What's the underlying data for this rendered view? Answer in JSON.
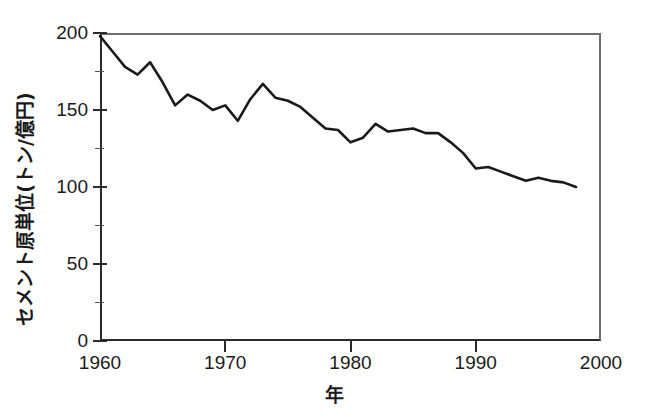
{
  "chart_data": {
    "type": "line",
    "title": "",
    "subtitle": "",
    "xlabel": "年",
    "ylabel": "セメント原単位(トン/億円)",
    "xlim": [
      1960,
      2000
    ],
    "ylim": [
      0,
      200
    ],
    "grid": false,
    "legend": null,
    "x_ticks": [
      1960,
      1970,
      1980,
      1990,
      2000
    ],
    "x_tick_labels": [
      "1960",
      "1970",
      "1980",
      "1990",
      "2000"
    ],
    "y_ticks": [
      0,
      50,
      100,
      150,
      200
    ],
    "y_tick_labels": [
      "0",
      "50",
      "100",
      "150",
      "200"
    ],
    "y_minor_ticks": [
      25,
      75,
      125,
      175
    ],
    "line_color": "#1a1a1a",
    "axis_color": "#2b2b2b",
    "series": [
      {
        "name": "セメント原単位",
        "x": [
          1960,
          1961,
          1962,
          1963,
          1964,
          1965,
          1966,
          1967,
          1968,
          1969,
          1970,
          1971,
          1972,
          1973,
          1974,
          1975,
          1976,
          1977,
          1978,
          1979,
          1980,
          1981,
          1982,
          1983,
          1984,
          1985,
          1986,
          1987,
          1988,
          1989,
          1990,
          1991,
          1992,
          1993,
          1994,
          1995,
          1996,
          1997,
          1998
        ],
        "y": [
          198,
          188,
          178,
          173,
          181,
          168,
          153,
          160,
          156,
          150,
          153,
          143,
          157,
          167,
          158,
          156,
          152,
          145,
          138,
          137,
          129,
          132,
          141,
          136,
          137,
          138,
          135,
          135,
          129,
          122,
          112,
          113,
          110,
          107,
          104,
          106,
          104,
          103,
          100
        ]
      }
    ]
  },
  "axis_titles": {
    "y": "セメント原単位(トン/億円)",
    "x": "年"
  }
}
